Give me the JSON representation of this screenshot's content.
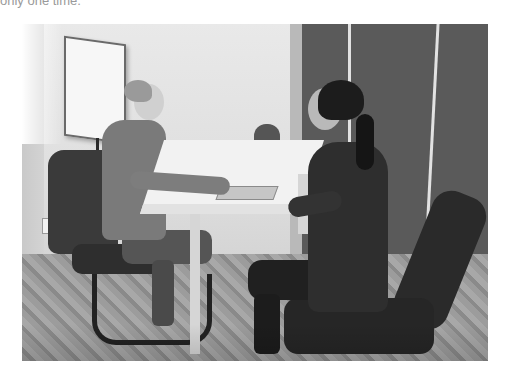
{
  "caption": {
    "text": "only one time."
  },
  "photo": {
    "description": "Black-and-white photo of two women seated across a white table in a small office meeting room",
    "scene": {
      "left_person": "woman with blonde hair in a bun, long-sleeve top, jeans, seated in a cantilever office chair",
      "right_person": "woman with dark ponytail, leather jacket, seated in a dark office chair",
      "props": [
        "flipchart easel",
        "white rectangular table",
        "laptop on table",
        "dark wall panels",
        "patterned carpet",
        "empty chair in background"
      ]
    },
    "colors": {
      "background": "#ffffff",
      "wall": "#e2e2e2",
      "panels": "#5a5a5a",
      "carpet": "#9c9c9c",
      "table": "#f2f2f2"
    }
  }
}
